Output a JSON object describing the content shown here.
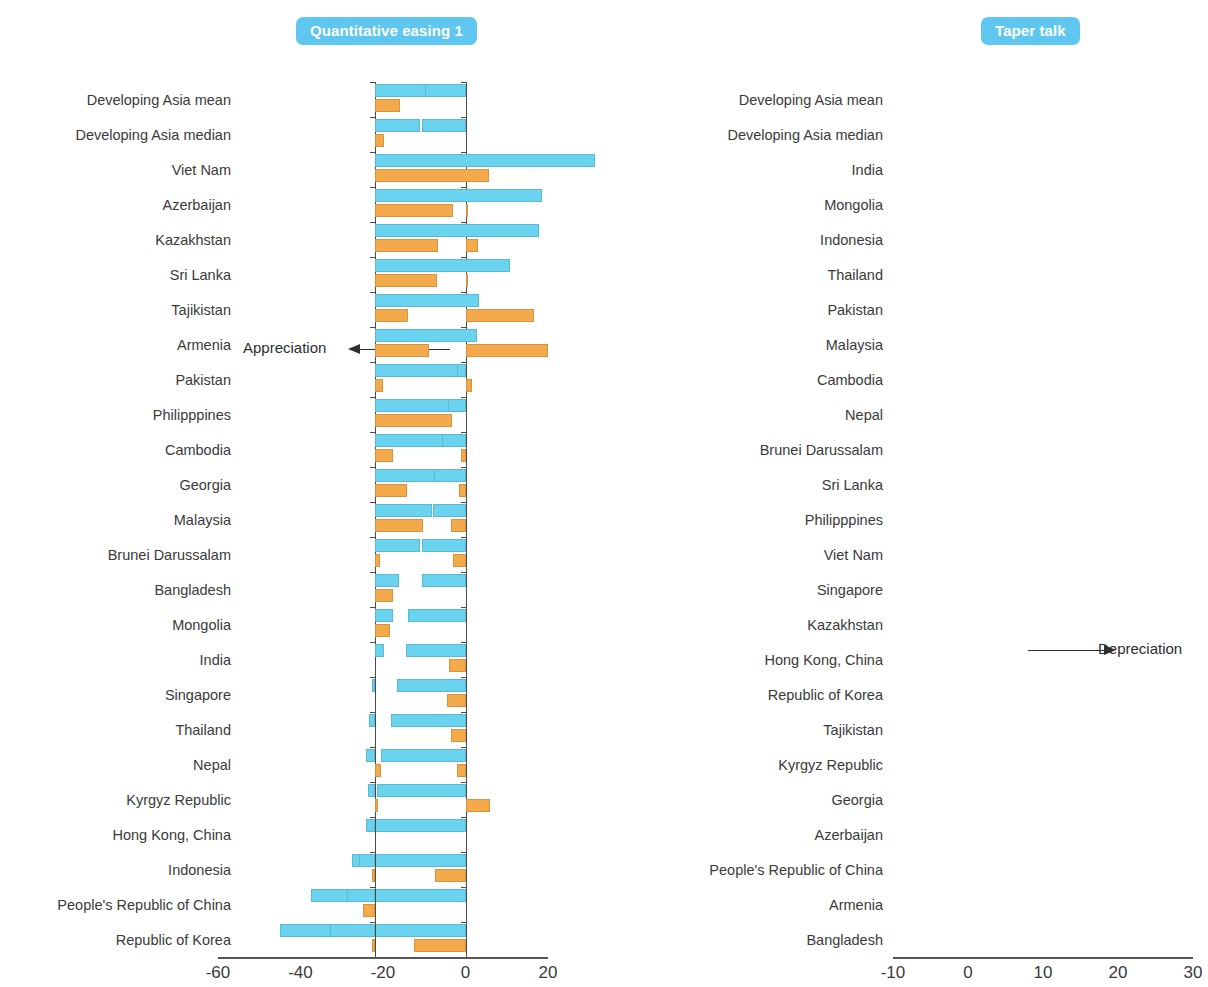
{
  "figure": {
    "background": "#ffffff",
    "colors": {
      "blue": "#6ad3f0",
      "orange": "#f4a94a",
      "title_badge": "#5ec6ef",
      "axis": "#4a4a4a",
      "text": "#3a3a3a"
    },
    "annotations": {
      "appreciation": "Appreciation",
      "depreciation": "Depreciation"
    }
  },
  "panels": [
    {
      "id": "left",
      "title": "Quantitative easing  1"
    },
    {
      "id": "right",
      "title": "Taper talk"
    }
  ],
  "chart_data": [
    {
      "type": "bar",
      "title": "Quantitative easing  1",
      "orientation": "horizontal",
      "xlabel": "",
      "ylabel": "",
      "xlim": [
        -65,
        22
      ],
      "grid": false,
      "legend": null,
      "annotation": "Appreciation",
      "annotation_direction": "left",
      "ticks": [
        "-60",
        "-40",
        "-20",
        "0",
        "20"
      ],
      "tick_values": [
        -60,
        -40,
        -20,
        0,
        20
      ],
      "categories": [
        "Developing Asia mean",
        "Developing Asia median",
        "Viet Nam",
        "Azerbaijan",
        "Kazakhstan",
        "Sri Lanka",
        "Tajikistan",
        "Armenia",
        "Pakistan",
        "Philipppines",
        "Cambodia",
        "Georgia",
        "Malaysia",
        "Brunei Darussalam",
        "Bangladesh",
        "Mongolia",
        "India",
        "Singapore",
        "Thailand",
        "Nepal",
        "Kyrgyz Republic",
        "Hong Kong, China",
        "Indonesia",
        "People's Republic of China",
        "Republic of Korea"
      ],
      "series": [
        {
          "name": "blue",
          "color": "#6ad3f0",
          "values": [
            -12.0,
            -10.5,
            8.0,
            3.5,
            1.0,
            1.5,
            0.0,
            -4.0,
            -8.5,
            -7.5,
            -8.0,
            -8.5,
            -8.0,
            -10.5,
            -10.5,
            -14.0,
            -14.5,
            -16.5,
            -18.0,
            -20.5,
            -21.5,
            -22.5,
            -27.5,
            -37.5,
            -45.0
          ]
        },
        {
          "name": "orange",
          "color": "#f4a94a",
          "values": [
            0.0,
            0.0,
            0.0,
            0.5,
            3.0,
            0.5,
            16.5,
            20.0,
            1.5,
            0.0,
            -1.0,
            -1.5,
            -3.5,
            -3.0,
            0.0,
            0.0,
            -4.0,
            -4.5,
            -3.5,
            -2.0,
            6.0,
            0.0,
            -7.5,
            0.0,
            -12.5
          ]
        }
      ]
    },
    {
      "type": "bar",
      "title": "Taper talk",
      "orientation": "horizontal",
      "xlabel": "",
      "ylabel": "",
      "xlim": [
        -12,
        31
      ],
      "grid": false,
      "legend": null,
      "annotation": "Depreciation",
      "annotation_direction": "right",
      "ticks": [
        "-10",
        "0",
        "10",
        "20",
        "30"
      ],
      "tick_values": [
        -10,
        0,
        10,
        20,
        30
      ],
      "categories": [
        "Developing Asia mean",
        "Developing Asia median",
        "India",
        "Mongolia",
        "Indonesia",
        "Thailand",
        "Pakistan",
        "Malaysia",
        "Cambodia",
        "Nepal",
        "Brunei Darussalam",
        "Sri Lanka",
        "Philipppines",
        "Viet Nam",
        "Singapore",
        "Kazakhstan",
        "Hong Kong, China",
        "Republic of Korea",
        "Tajikistan",
        "Kyrgyz Republic",
        "Georgia",
        "Azerbaijan",
        "People's Republic of China",
        "Armenia",
        "Bangladesh"
      ],
      "series": [
        {
          "name": "blue",
          "color": "#6ad3f0",
          "values": [
            6.8,
            6.0,
            29.3,
            22.3,
            21.8,
            18.0,
            13.8,
            13.6,
            11.0,
            9.8,
            9.0,
            8.0,
            7.6,
            6.0,
            3.2,
            2.4,
            1.2,
            -0.4,
            -0.8,
            -1.2,
            -1.0,
            -1.2,
            -2.2,
            -3.8,
            -6.0
          ]
        },
        {
          "name": "orange",
          "color": "#f4a94a",
          "values": [
            3.3,
            1.2,
            15.2,
            10.4,
            8.4,
            8.2,
            4.4,
            7.2,
            1.0,
            10.2,
            2.4,
            4.2,
            6.4,
            0.6,
            2.4,
            2.0,
            0.0,
            0.0,
            0.0,
            0.8,
            0.4,
            0.0,
            -0.4,
            -1.6,
            -0.4
          ]
        }
      ]
    }
  ]
}
